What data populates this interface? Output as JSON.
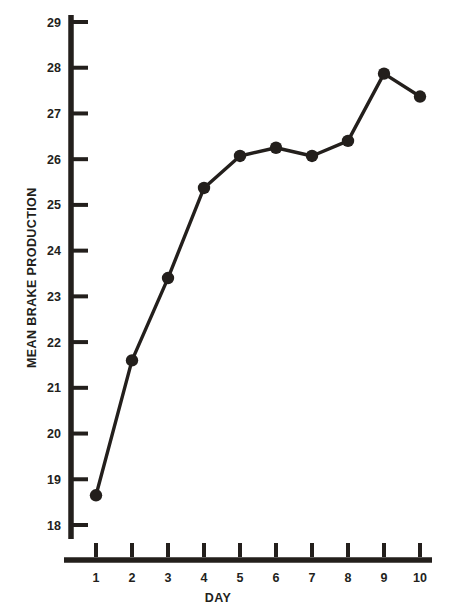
{
  "chart_data": {
    "type": "line",
    "title": "",
    "xlabel": "DAY",
    "ylabel": "MEAN BRAKE PRODUCTION",
    "x": [
      1,
      2,
      3,
      4,
      5,
      6,
      7,
      8,
      9,
      10
    ],
    "values": [
      18.65,
      21.6,
      23.4,
      25.37,
      26.07,
      26.25,
      26.07,
      26.4,
      27.87,
      27.37
    ],
    "categories": [
      "1",
      "2",
      "3",
      "4",
      "5",
      "6",
      "7",
      "8",
      "9",
      "10"
    ],
    "xtick_labels": [
      "1",
      "2",
      "3",
      "4",
      "5",
      "6",
      "7",
      "8",
      "9",
      "10"
    ],
    "ytick_labels": [
      "18",
      "19",
      "20",
      "21",
      "22",
      "23",
      "24",
      "25",
      "26",
      "27",
      "28",
      "29"
    ],
    "yticks": [
      18,
      19,
      20,
      21,
      22,
      23,
      24,
      25,
      26,
      27,
      28,
      29
    ],
    "ylim": [
      18,
      29
    ],
    "xlim": [
      1,
      10
    ],
    "grid": false,
    "legend": false,
    "marker": "filled-circle",
    "line_color": "#231f1c",
    "marker_color": "#231f1c",
    "background_color": "#ffffff"
  }
}
